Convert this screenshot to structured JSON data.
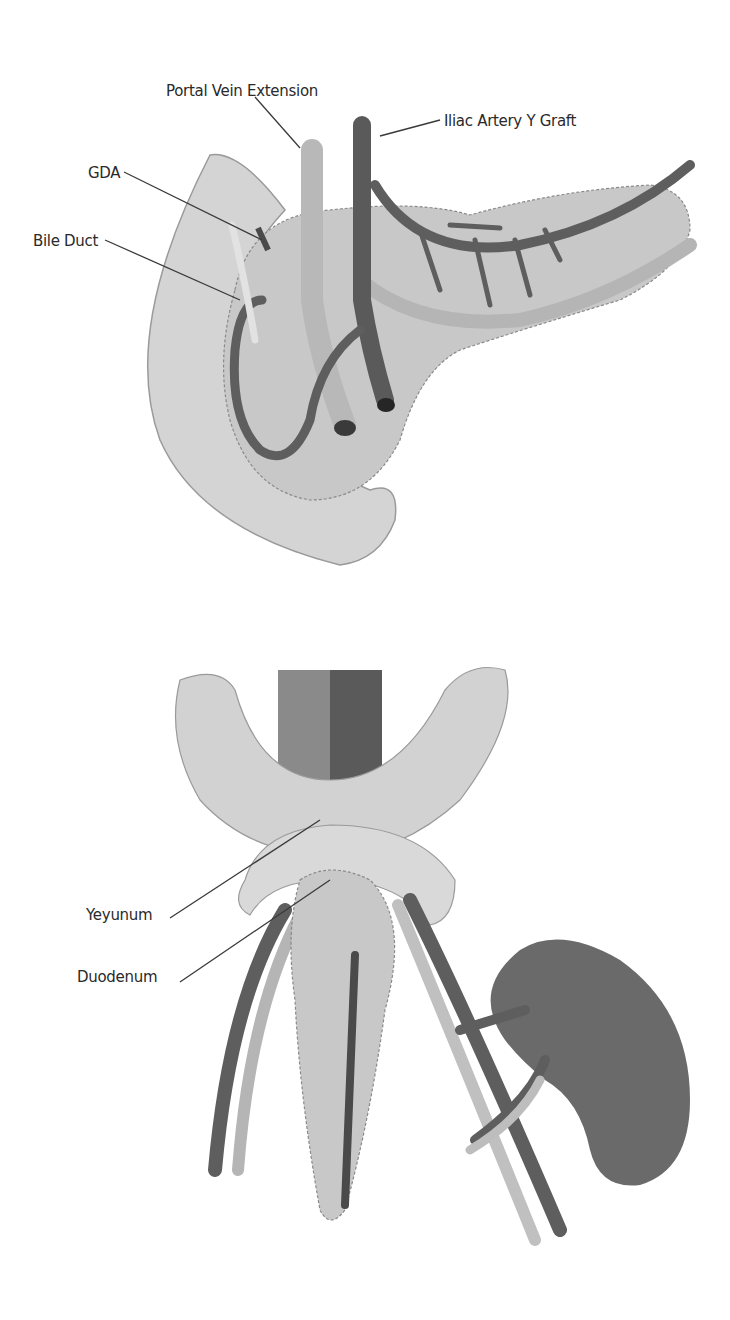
{
  "figures": [
    {
      "id": "top",
      "subject": "pancreas graft with duodenum (back-table reconstruction)",
      "labels": [
        {
          "text": "Portal Vein Extension",
          "x": 166,
          "y": 82
        },
        {
          "text": "Iliac Artery Y Graft",
          "x": 444,
          "y": 112
        },
        {
          "text": "GDA",
          "x": 88,
          "y": 164
        },
        {
          "text": "Bile Duct",
          "x": 33,
          "y": 232
        }
      ]
    },
    {
      "id": "bottom",
      "subject": "implanted pancreas graft with kidney",
      "labels": [
        {
          "text": "Yeyunum",
          "x": 86,
          "y": 906
        },
        {
          "text": "Duodenum",
          "x": 77,
          "y": 968
        }
      ]
    }
  ],
  "colors": {
    "background": "#ffffff",
    "organ_light": "#d6d6d6",
    "organ_mid": "#bdbdbd",
    "vessel_dark": "#5e5e5e",
    "vessel_light": "#b0b0b0",
    "kidney": "#6a6a6a",
    "label_text": "#2a2a2a",
    "leader_line": "#3a3a3a"
  }
}
